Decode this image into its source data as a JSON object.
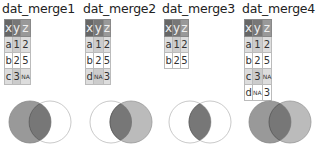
{
  "panels": [
    {
      "title": "dat_merge1",
      "headers": [
        "x",
        "y",
        "z"
      ],
      "rows": [
        [
          "a",
          "1",
          "2"
        ],
        [
          "b",
          "2",
          "5"
        ],
        [
          "c",
          "3",
          "NA"
        ]
      ],
      "venn": "left"
    },
    {
      "title": "dat_merge2",
      "headers": [
        "x",
        "y",
        "z"
      ],
      "rows": [
        [
          "a",
          "1",
          "2"
        ],
        [
          "b",
          "2",
          "5"
        ],
        [
          "d",
          "NA",
          "3"
        ]
      ],
      "venn": "right"
    },
    {
      "title": "dat_merge3",
      "headers": [
        "x",
        "y",
        "z"
      ],
      "rows": [
        [
          "a",
          "1",
          "2"
        ],
        [
          "b",
          "2",
          "5"
        ]
      ],
      "venn": "inner"
    },
    {
      "title": "dat_merge4",
      "headers": [
        "x",
        "y",
        "z"
      ],
      "rows": [
        [
          "a",
          "1",
          "2"
        ],
        [
          "b",
          "2",
          "5"
        ],
        [
          "c",
          "3",
          "NA"
        ],
        [
          "d",
          "NA",
          "3"
        ]
      ],
      "venn": "full"
    }
  ],
  "colors": {
    "header_x": "#666666",
    "header_y": "#777777",
    "header_z": "#999999",
    "venn_left_fill": "#999999",
    "venn_right_fill": "#bbbbbb",
    "venn_overlap_fill": "#777777",
    "venn_outline": "#bbbbbb"
  }
}
